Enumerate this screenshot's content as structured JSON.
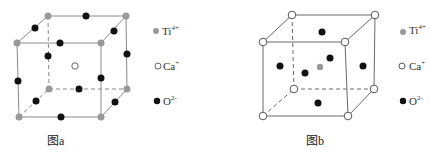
{
  "figures": [
    {
      "id": "a",
      "caption": "图a",
      "description": "Perovskite CaTiO3 unit cell with Ti4+ at corners, O2- at edge midpoints, Ca+ at body center"
    },
    {
      "id": "b",
      "caption": "图b",
      "description": "Perovskite CaTiO3 unit cell with Ca+ at corners, O2- at face centers, Ti4+ at body center"
    }
  ],
  "legend": [
    {
      "symbol": "gray-filled-circle",
      "ion": "Ti",
      "charge": "4+",
      "color": "#999999"
    },
    {
      "symbol": "open-circle",
      "ion": "Ca",
      "charge": "+",
      "color": "#ffffff"
    },
    {
      "symbol": "black-filled-circle",
      "ion": "O",
      "charge": "2-",
      "color": "#111111"
    }
  ],
  "colors": {
    "ti": "#999999",
    "ca": "#ffffff",
    "o": "#111111",
    "edge_a": "#8a8a8a",
    "edge_b": "#6a6a6a"
  }
}
